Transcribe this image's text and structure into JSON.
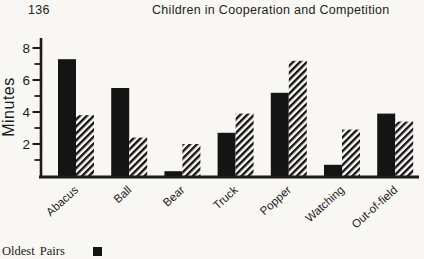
{
  "header": {
    "page_number": "136",
    "running_title": "Children in Cooperation and Competition"
  },
  "legend": {
    "items": [
      {
        "label": "Oldest Pairs",
        "swatch": "solid-black-square"
      }
    ]
  },
  "chart_data": {
    "type": "bar",
    "title": "",
    "xlabel": "",
    "ylabel": "Minutes",
    "categories": [
      "Abacus",
      "Ball",
      "Bear",
      "Truck",
      "Popper",
      "Watching",
      "Out-of-field"
    ],
    "series": [
      {
        "name": "Oldest Pairs",
        "fill": "solid-black",
        "values": [
          7.3,
          5.5,
          0.3,
          2.7,
          5.2,
          0.7,
          3.9
        ]
      },
      {
        "name": "",
        "fill": "diagonal-hatch",
        "values": [
          3.8,
          2.4,
          2.0,
          3.9,
          7.2,
          2.9,
          3.4
        ]
      }
    ],
    "y_ticks_labeled": [
      2,
      4,
      6,
      8
    ],
    "y_ticks_minor": [
      1,
      3,
      5,
      7
    ],
    "ylim": [
      0,
      8.6
    ],
    "grid": false,
    "legend_position": "below-left",
    "colors": {
      "bar": "#141414",
      "text": "#1b1b1b",
      "paper": "#f8f7f4",
      "hatch_bg": "#fcfbf9"
    }
  }
}
